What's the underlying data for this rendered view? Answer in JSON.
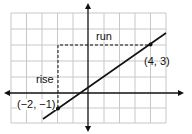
{
  "diagram": {
    "type": "coordinate-plane-slope",
    "labels": {
      "run": "run",
      "rise": "rise",
      "point1": "(−2, −1)",
      "point2": "(4, 3)"
    },
    "points": [
      {
        "x": -2,
        "y": -1
      },
      {
        "x": 4,
        "y": 3
      }
    ],
    "grid": {
      "x_range": [
        -5,
        5
      ],
      "y_range": [
        -2,
        5
      ]
    },
    "colors": {
      "grid": "#c8c8c8",
      "line": "#111111",
      "background": "#ffffff"
    }
  }
}
